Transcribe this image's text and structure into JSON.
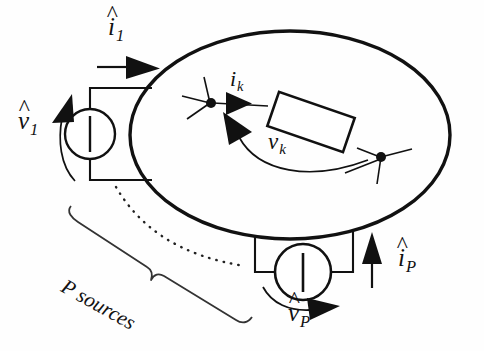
{
  "figure": {
    "type": "circuit-diagram",
    "stroke_color": "#111111",
    "background_color": "#fefefe"
  },
  "labels": {
    "port1_current": {
      "symbol": "i",
      "subscript": "1",
      "hat": "^",
      "text": "i",
      "sub": "1"
    },
    "port1_voltage": {
      "symbol": "v",
      "subscript": "1",
      "hat": "^",
      "text": "v",
      "sub": "1"
    },
    "branch_current": {
      "symbol": "i",
      "subscript": "k",
      "hat": "",
      "text": "i",
      "sub": "k"
    },
    "branch_voltage": {
      "symbol": "v",
      "subscript": "k",
      "hat": "",
      "text": "v",
      "sub": "k"
    },
    "portP_current": {
      "symbol": "i",
      "subscript": "P",
      "hat": "^",
      "text": "i",
      "sub": "P"
    },
    "portP_voltage": {
      "symbol": "v",
      "subscript": "P",
      "hat": "^",
      "text": "v",
      "sub": "P"
    },
    "brace_label": {
      "text": "P sources",
      "rotation_deg": 29
    },
    "hat_glyph": "^"
  },
  "elements": {
    "network_boundary": "ellipse",
    "source_1": "voltage-source-circle",
    "source_P": "voltage-source-circle",
    "branch_element": "rectangle-impedance",
    "node_left": "junction-dot",
    "node_right": "junction-dot",
    "continuation": "dotted-arc",
    "grouping": "curly-brace"
  }
}
